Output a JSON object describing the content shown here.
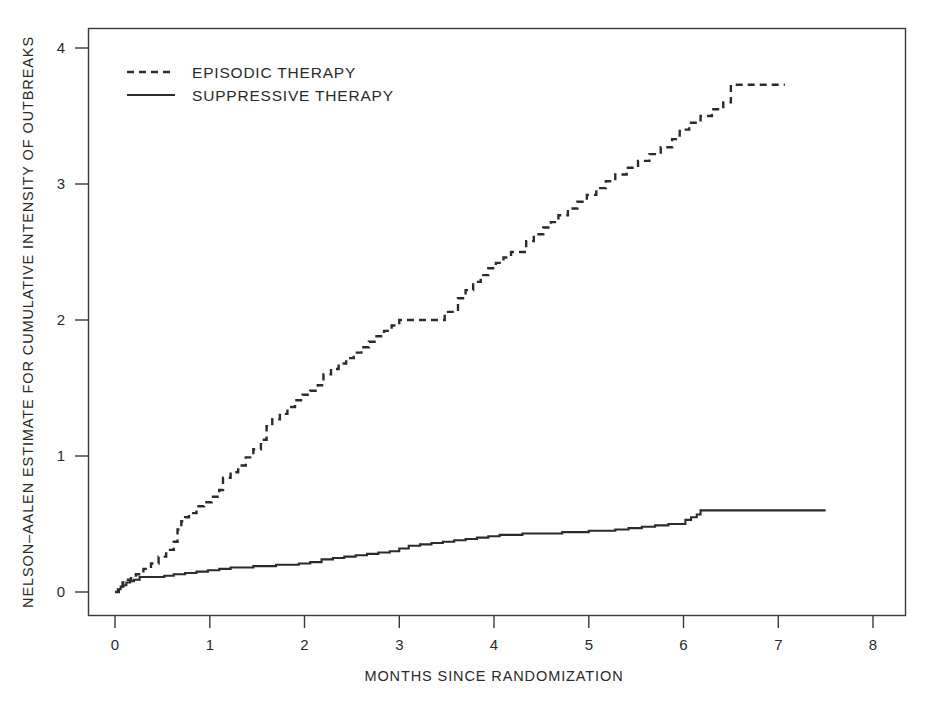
{
  "chart_data": {
    "type": "line",
    "title": "",
    "subtitle": "",
    "xlabel": "MONTHS SINCE RANDOMIZATION",
    "ylabel": "NELSON-AALEN ESTIMATE FOR CUMULATIVE INTENSITY OF OUTBREAKS",
    "xlim": [
      -0.14,
      8.6
    ],
    "ylim": [
      -0.18,
      4.3
    ],
    "xticks": [
      0,
      1,
      2,
      3,
      4,
      5,
      6,
      7,
      8
    ],
    "xticklabels": [
      "0",
      "1",
      "2",
      "3",
      "4",
      "5",
      "6",
      "7",
      "8"
    ],
    "yticks": [
      0,
      1,
      2,
      3,
      4
    ],
    "yticklabels": [
      "0",
      "1",
      "2",
      "3",
      "4"
    ],
    "grid": false,
    "legend_position": "upper-left",
    "legend": [
      {
        "name": "EPISODIC THERAPY",
        "style": "dashed",
        "color": "#2b2b2b"
      },
      {
        "name": "SUPPRESSIVE THERAPY",
        "style": "solid",
        "color": "#2b2b2b"
      }
    ],
    "step_interpolation": "post",
    "series": [
      {
        "name": "EPISODIC THERAPY",
        "style": "dashed",
        "color": "#2b2b2b",
        "x": [
          0.0,
          0.04,
          0.08,
          0.12,
          0.17,
          0.22,
          0.3,
          0.38,
          0.46,
          0.54,
          0.62,
          0.66,
          0.7,
          0.74,
          0.78,
          0.86,
          0.94,
          1.02,
          1.1,
          1.14,
          1.22,
          1.3,
          1.38,
          1.46,
          1.54,
          1.6,
          1.66,
          1.74,
          1.82,
          1.9,
          1.98,
          2.06,
          2.14,
          2.2,
          2.28,
          2.36,
          2.44,
          2.52,
          2.6,
          2.68,
          2.76,
          2.84,
          2.92,
          3.0,
          3.08,
          3.16,
          3.24,
          3.32,
          3.4,
          3.48,
          3.62,
          3.7,
          3.78,
          3.86,
          3.94,
          4.02,
          4.1,
          4.18,
          4.26,
          4.34,
          4.42,
          4.52,
          4.6,
          4.68,
          4.78,
          4.88,
          4.98,
          5.08,
          5.18,
          5.28,
          5.4,
          5.52,
          5.64,
          5.76,
          5.88,
          5.96,
          6.06,
          6.18,
          6.3,
          6.42,
          6.5,
          7.07
        ],
        "y": [
          0.0,
          0.04,
          0.07,
          0.09,
          0.11,
          0.13,
          0.17,
          0.21,
          0.26,
          0.31,
          0.37,
          0.46,
          0.52,
          0.55,
          0.58,
          0.63,
          0.66,
          0.7,
          0.75,
          0.84,
          0.88,
          0.93,
          0.99,
          1.05,
          1.12,
          1.22,
          1.27,
          1.31,
          1.36,
          1.41,
          1.45,
          1.48,
          1.52,
          1.6,
          1.64,
          1.68,
          1.72,
          1.76,
          1.8,
          1.84,
          1.88,
          1.92,
          1.96,
          2.0,
          2.0,
          2.0,
          2.0,
          2.0,
          2.0,
          2.06,
          2.16,
          2.22,
          2.28,
          2.33,
          2.38,
          2.42,
          2.46,
          2.5,
          2.5,
          2.58,
          2.63,
          2.68,
          2.72,
          2.77,
          2.82,
          2.87,
          2.92,
          2.97,
          3.02,
          3.07,
          3.12,
          3.17,
          3.22,
          3.27,
          3.33,
          3.4,
          3.45,
          3.5,
          3.55,
          3.6,
          3.73,
          3.73
        ]
      },
      {
        "name": "SUPPRESSIVE THERAPY",
        "style": "solid",
        "color": "#2b2b2b",
        "x": [
          0.0,
          0.03,
          0.06,
          0.09,
          0.12,
          0.16,
          0.2,
          0.26,
          0.34,
          0.42,
          0.52,
          0.62,
          0.74,
          0.86,
          0.98,
          1.1,
          1.22,
          1.34,
          1.46,
          1.58,
          1.7,
          1.82,
          1.94,
          2.06,
          2.18,
          2.3,
          2.42,
          2.54,
          2.66,
          2.78,
          2.9,
          3.0,
          3.1,
          3.22,
          3.34,
          3.46,
          3.58,
          3.7,
          3.82,
          3.94,
          4.06,
          4.18,
          4.3,
          4.44,
          4.58,
          4.72,
          4.86,
          5.0,
          5.14,
          5.28,
          5.42,
          5.56,
          5.7,
          5.84,
          5.96,
          6.02,
          6.08,
          6.14,
          6.18,
          7.5
        ],
        "y": [
          0.0,
          0.02,
          0.04,
          0.05,
          0.07,
          0.08,
          0.09,
          0.11,
          0.11,
          0.11,
          0.12,
          0.13,
          0.14,
          0.15,
          0.16,
          0.17,
          0.18,
          0.18,
          0.19,
          0.19,
          0.2,
          0.2,
          0.21,
          0.22,
          0.24,
          0.25,
          0.26,
          0.27,
          0.28,
          0.29,
          0.3,
          0.32,
          0.34,
          0.35,
          0.36,
          0.37,
          0.38,
          0.39,
          0.4,
          0.41,
          0.42,
          0.42,
          0.43,
          0.43,
          0.43,
          0.44,
          0.44,
          0.45,
          0.45,
          0.46,
          0.47,
          0.48,
          0.49,
          0.5,
          0.5,
          0.53,
          0.55,
          0.57,
          0.6,
          0.6
        ]
      }
    ]
  },
  "axes": {
    "x_title": "MONTHS SINCE RANDOMIZATION",
    "y_title": "NELSON–AALEN ESTIMATE FOR CUMULATIVE INTENSITY OF OUTBREAKS"
  },
  "legend": {
    "episodic_label": "EPISODIC THERAPY",
    "suppressive_label": "SUPPRESSIVE THERAPY"
  }
}
